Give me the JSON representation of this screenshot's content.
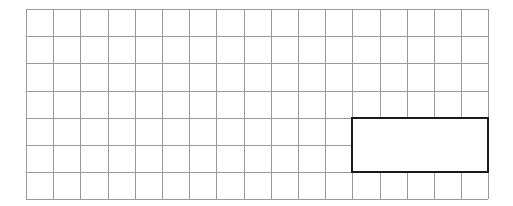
{
  "figure": {
    "canvas": {
      "width": 513,
      "height": 206,
      "background_color": "#ffffff"
    }
  },
  "grid": {
    "name": "square-grid",
    "columns": 17,
    "rows": 7,
    "cell_size_px": 27.2,
    "origin_x_px": 26,
    "origin_y_px": 9,
    "line_color": "#9a9a9a",
    "line_width_px": 1,
    "fill_color": "#ffffff"
  },
  "shapes": [
    {
      "name": "highlight-rectangle",
      "type": "rectangle",
      "units": "grid-cells",
      "start_column": 12,
      "start_row": 4,
      "width_cells": 5,
      "height_cells": 2,
      "area_cells": 10,
      "perimeter_cells": 14,
      "stroke_color": "#1a1a1a",
      "stroke_width_px": 2,
      "fill_color": "#ffffff"
    }
  ],
  "chart_data": {
    "type": "table",
    "xlabel": "",
    "ylabel": "",
    "grid": true,
    "categories": [
      "columns",
      "rows",
      "rect_width_cells",
      "rect_height_cells",
      "rect_area_cells",
      "rect_perimeter_cells"
    ],
    "values": [
      17,
      7,
      5,
      2,
      10,
      14
    ]
  }
}
